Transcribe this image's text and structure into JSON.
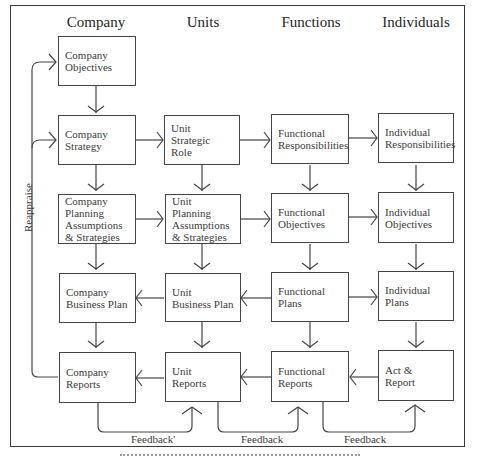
{
  "diagram": {
    "columns": [
      {
        "id": "company",
        "label": "Company"
      },
      {
        "id": "units",
        "label": "Units"
      },
      {
        "id": "functions",
        "label": "Functions"
      },
      {
        "id": "individuals",
        "label": "Individuals"
      }
    ],
    "boxes": {
      "company_objectives": [
        "Company",
        "Objectives"
      ],
      "company_strategy": [
        "Company",
        "Strategy"
      ],
      "company_planning": [
        "Company",
        "Planning",
        "Assumptions",
        "& Strategies"
      ],
      "company_business_plan": [
        "Company",
        "Business Plan"
      ],
      "company_reports": [
        "Company",
        "Reports"
      ],
      "unit_strategic_role": [
        "Unit",
        "Strategic",
        "Role"
      ],
      "unit_planning": [
        "Unit",
        "Planning",
        "Assumptions",
        "& Strategies"
      ],
      "unit_business_plan": [
        "Unit",
        "Business Plan"
      ],
      "unit_reports": [
        "Unit",
        "Reports"
      ],
      "functional_responsibilities": [
        "Functional",
        "Responsibilities"
      ],
      "functional_objectives": [
        "Functional",
        "Objectives"
      ],
      "functional_plans": [
        "Functional",
        "Plans"
      ],
      "functional_reports": [
        "Functional",
        "Reports"
      ],
      "individual_responsibilities": [
        "Individual",
        "Responsibilities"
      ],
      "individual_objectives": [
        "Individual",
        "Objectives"
      ],
      "individual_plans": [
        "Individual",
        "Plans"
      ],
      "act_report": [
        "Act &",
        "Report"
      ]
    },
    "loop_labels": {
      "reappraise": "Reappraise",
      "feedback_1": "Feedback'",
      "feedback_2": "Feedback",
      "feedback_3": "Feedback"
    },
    "colors": {
      "line": "#444444",
      "text": "#3a3a3a",
      "background": "#ffffff"
    }
  }
}
